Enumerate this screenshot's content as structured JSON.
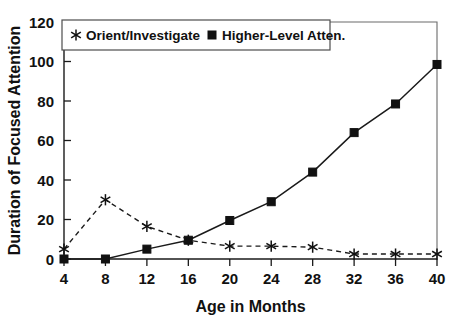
{
  "chart_data": {
    "type": "line",
    "title": "",
    "xlabel": "Age in Months",
    "ylabel": "Duration of Focused Attention",
    "x": [
      4,
      8,
      12,
      16,
      20,
      24,
      28,
      32,
      36,
      40
    ],
    "xticklabels": [
      "4",
      "8",
      "12",
      "16",
      "20",
      "24",
      "28",
      "32",
      "36",
      "40"
    ],
    "yticklabels": [
      "0",
      "20",
      "40",
      "60",
      "80",
      "100",
      "120"
    ],
    "yticks": [
      0,
      20,
      40,
      60,
      80,
      100,
      120
    ],
    "xlim": [
      4,
      40
    ],
    "ylim": [
      0,
      120
    ],
    "grid": false,
    "legend_position": "top-center",
    "series": [
      {
        "name": "Orient/Investigate",
        "marker": "star-asterisk",
        "linestyle": "dashed",
        "color": "#111111",
        "values": [
          5,
          30,
          16.5,
          9.5,
          6.5,
          6.5,
          6,
          2.5,
          2.5,
          2.5
        ]
      },
      {
        "name": "Higher-Level Atten.",
        "marker": "filled-square",
        "linestyle": "solid",
        "color": "#111111",
        "values": [
          0,
          0,
          5,
          9.5,
          19.5,
          29,
          44,
          64,
          78.5,
          98.5
        ]
      }
    ]
  },
  "legend": {
    "entries": [
      {
        "label": "Orient/Investigate",
        "marker": "star-asterisk"
      },
      {
        "label": "Higher-Level Atten.",
        "marker": "filled-square"
      }
    ]
  },
  "axes": {
    "x_title": "Age in Months",
    "y_title": "Duration of Focused Attention"
  }
}
